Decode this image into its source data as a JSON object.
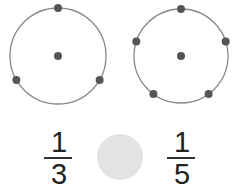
{
  "diagram": {
    "left_circle": {
      "divisions": 3,
      "points": 3
    },
    "right_circle": {
      "divisions": 5,
      "points": 5
    },
    "colors": {
      "circle_stroke": "#888888",
      "dot": "#555555",
      "blank_disc": "#e3e3e3"
    },
    "fractions": [
      {
        "numerator": "1",
        "denominator": "3"
      },
      {
        "numerator": "1",
        "denominator": "5"
      }
    ],
    "comparison_blank": ""
  }
}
